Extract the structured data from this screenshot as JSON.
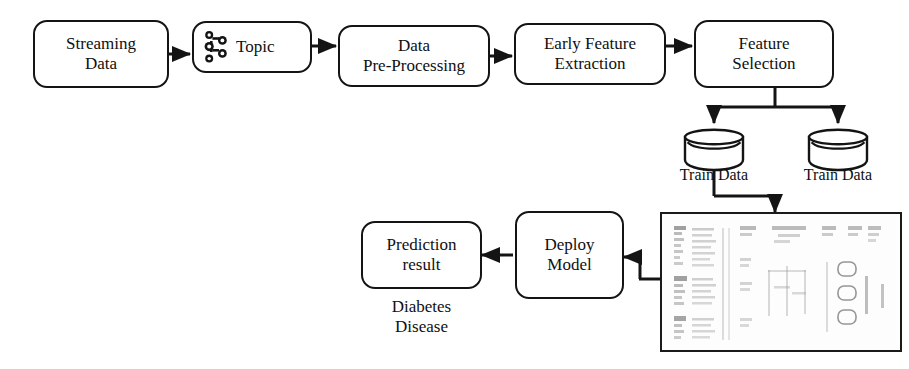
{
  "diagram": {
    "canvas": {
      "width": 909,
      "height": 369
    },
    "colors": {
      "stroke": "#141414",
      "background": "#ffffff",
      "text": "#101010",
      "thumbnail_border": "#1a1a1a",
      "thumbnail_fill": "#fdfdfd",
      "thumbnail_marks": "#8c8c8c"
    },
    "nodes": {
      "streaming_data": {
        "label": "Streaming\nData"
      },
      "topic": {
        "label": "Topic",
        "icon": "kafka-icon"
      },
      "data_preprocessing": {
        "label": "Data\nPre-Processing"
      },
      "early_feature_extraction": {
        "label": "Early Feature\nExtraction"
      },
      "feature_selection": {
        "label": "Feature\nSelection"
      },
      "train_data_left": {
        "label": "Train Data",
        "shape": "cylinder"
      },
      "train_data_right": {
        "label": "Train Data",
        "shape": "cylinder"
      },
      "data_table": {
        "label": "",
        "shape": "document-thumbnail"
      },
      "deploy_model": {
        "label": "Deploy\nModel"
      },
      "prediction_result": {
        "label": "Prediction\nresult"
      }
    },
    "captions": {
      "diabetes_disease": "Diabetes\nDisease"
    },
    "edges": [
      {
        "from": "streaming_data",
        "to": "topic"
      },
      {
        "from": "topic",
        "to": "data_preprocessing"
      },
      {
        "from": "data_preprocessing",
        "to": "early_feature_extraction"
      },
      {
        "from": "early_feature_extraction",
        "to": "feature_selection"
      },
      {
        "from": "feature_selection",
        "to": "train_data_left"
      },
      {
        "from": "feature_selection",
        "to": "train_data_right"
      },
      {
        "from": "train_data_left",
        "to": "data_table"
      },
      {
        "from": "data_table",
        "to": "deploy_model"
      },
      {
        "from": "deploy_model",
        "to": "prediction_result"
      }
    ]
  }
}
